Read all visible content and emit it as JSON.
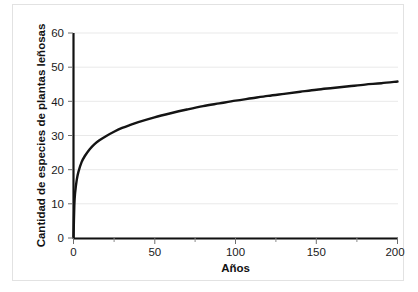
{
  "chart_data": {
    "type": "line",
    "title": "",
    "subtitle": "",
    "xlabel": "Años",
    "ylabel": "Cantidad de especies de plantas leñosas",
    "xlim": [
      0,
      200
    ],
    "ylim": [
      0,
      60
    ],
    "grid": true,
    "grid_axis": "y",
    "legend": false,
    "legend_position": "none",
    "x_ticks": [
      0,
      50,
      100,
      150,
      200
    ],
    "x_tick_labels": [
      "0",
      "50",
      "100",
      "150",
      "200"
    ],
    "x_minor_ticks": [
      25,
      75,
      125,
      175
    ],
    "y_ticks": [
      0,
      10,
      20,
      30,
      40,
      50,
      60
    ],
    "y_tick_labels": [
      "0",
      "10",
      "20",
      "30",
      "40",
      "50",
      "60"
    ],
    "series": [
      {
        "name": "Cantidad de especies de plantas leñosas",
        "color": "#141414",
        "x": [
          0,
          0.5,
          1,
          2,
          3,
          5,
          7,
          10,
          13,
          16,
          20,
          25,
          30,
          35,
          40,
          50,
          60,
          70,
          80,
          90,
          100,
          110,
          120,
          130,
          140,
          150,
          160,
          170,
          180,
          190,
          200
        ],
        "values": [
          0,
          9.5,
          13.2,
          17.0,
          19.3,
          22.2,
          24.0,
          26.0,
          27.5,
          28.6,
          29.8,
          31.1,
          32.2,
          33.1,
          33.9,
          35.3,
          36.5,
          37.6,
          38.6,
          39.4,
          40.2,
          40.9,
          41.6,
          42.2,
          42.8,
          43.4,
          43.9,
          44.4,
          44.9,
          45.3,
          45.8
        ]
      }
    ]
  },
  "axis": {
    "x_title": "Años",
    "y_title": "Cantidad de especies de plantas leñosas"
  }
}
